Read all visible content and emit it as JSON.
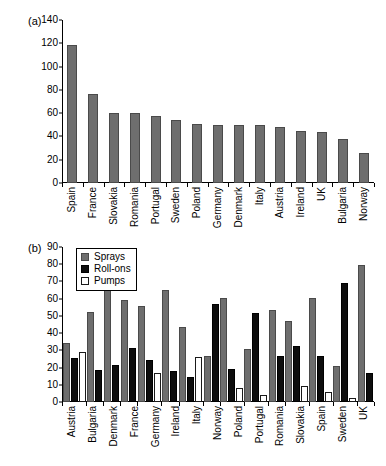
{
  "figure": {
    "panels": [
      {
        "label": "(a)"
      },
      {
        "label": "(b)"
      }
    ]
  },
  "chart_data": [
    {
      "type": "bar",
      "panel": "(a)",
      "title": "",
      "xlabel": "",
      "ylabel": "",
      "ylim": [
        0,
        140
      ],
      "yticks": [
        0,
        20,
        40,
        60,
        80,
        100,
        120,
        140
      ],
      "grid": false,
      "legend": null,
      "series_color": "#6e6e6e",
      "categories": [
        "Spain",
        "France",
        "Slovakia",
        "Romania",
        "Portugal",
        "Sweden",
        "Poland",
        "Germany",
        "Denmark",
        "Italy",
        "Austria",
        "Ireland",
        "UK",
        "Bulgaria",
        "Norway"
      ],
      "values": [
        117,
        75,
        58,
        58,
        55.5,
        52,
        49,
        48.5,
        48.5,
        48,
        46.5,
        43,
        42.5,
        36.5,
        24
      ]
    },
    {
      "type": "bar",
      "panel": "(b)",
      "title": "",
      "xlabel": "",
      "ylabel": "",
      "ylim": [
        0,
        90
      ],
      "yticks": [
        0,
        10,
        20,
        30,
        40,
        50,
        60,
        70,
        80,
        90
      ],
      "grid": false,
      "legend_position": "top-left",
      "categories": [
        "Austria",
        "Bulgaria",
        "Denmark",
        "France",
        "Germany",
        "Ireland",
        "Italy",
        "Norway",
        "Poland",
        "Portugal",
        "Romania",
        "Slovakia",
        "Spain",
        "Sweden",
        "UK"
      ],
      "series": [
        {
          "name": "Sprays",
          "color": "#6e6e6e",
          "values": [
            33,
            51,
            64,
            58,
            54.5,
            64,
            42.5,
            25.5,
            59.5,
            29.5,
            52.5,
            46,
            59.5,
            20,
            78.5
          ]
        },
        {
          "name": "Roll-ons",
          "color": "#0d0d0d",
          "values": [
            24.5,
            17.5,
            20.5,
            30,
            23,
            17,
            13.5,
            55.5,
            18,
            50.5,
            25.5,
            31.5,
            25.5,
            68,
            15.5
          ]
        },
        {
          "name": "Pumps",
          "color": "#ffffff",
          "values": [
            28,
            0,
            0,
            0,
            15.5,
            0,
            25,
            0,
            7,
            3,
            0,
            8,
            4.5,
            1,
            0
          ]
        }
      ]
    }
  ]
}
